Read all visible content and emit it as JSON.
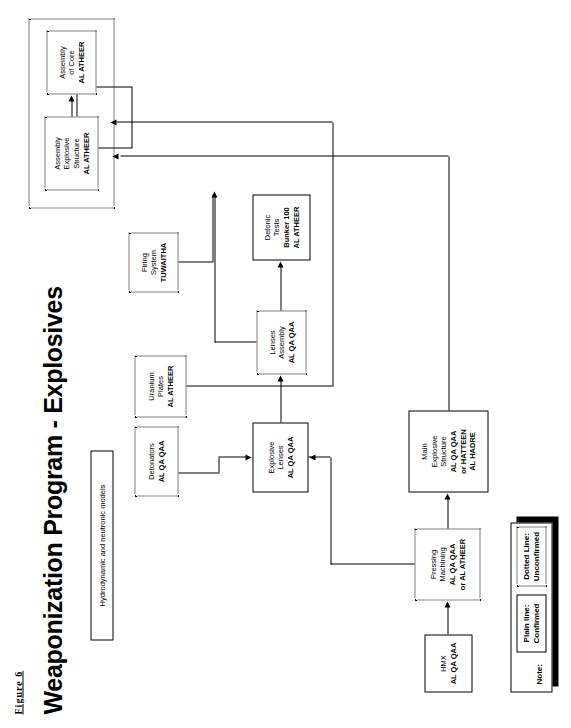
{
  "figure": {
    "label": "Figure 6"
  },
  "title": "Weaponization Program - Explosives",
  "nodes": {
    "models": {
      "lines": [
        "Hydrodynamic and neutronic models"
      ],
      "style": "solid"
    },
    "detonators": {
      "lines": [
        "Detonators",
        "AL QA QAA"
      ],
      "style": "dotted"
    },
    "uranium": {
      "lines": [
        "Uranium",
        "Plates",
        "AL ATHEER"
      ],
      "style": "dotted"
    },
    "hmx": {
      "lines": [
        "HMX",
        "AL QA QAA"
      ],
      "style": "solid"
    },
    "pressing": {
      "lines": [
        "Pressing",
        "Machining",
        "AL QA QAA",
        "or AL ATHEER"
      ],
      "style": "dotted"
    },
    "lenses": {
      "lines": [
        "Explosive",
        "Lenses",
        "AL QA QAA"
      ],
      "style": "solid"
    },
    "main_exp": {
      "lines": [
        "Main",
        "Explosive",
        "Structure",
        "AL QA QAA",
        "or HATTEEN",
        "AL HADRE"
      ],
      "style": "solid"
    },
    "lens_asm": {
      "lines": [
        "Lenses",
        "Assembly",
        "AL QA QAA"
      ],
      "style": "dotted"
    },
    "detonic": {
      "lines": [
        "Detonic",
        "Tests",
        "Bunker 100",
        "AL ATHEER"
      ],
      "style": "solid"
    },
    "firing": {
      "lines": [
        "Firing",
        "System",
        "TUWAITHA"
      ],
      "style": "dotted"
    },
    "asm_exp": {
      "lines": [
        "Assembly",
        "Explosive",
        "Structure",
        "AL ATHEER"
      ],
      "style": "dotted"
    },
    "asm_core": {
      "lines": [
        "Assembly",
        "of Core",
        "AL ATHEER"
      ],
      "style": "dotted"
    }
  },
  "bold_from": {
    "models": 9,
    "detonators": 1,
    "uranium": 2,
    "hmx": 1,
    "pressing": 2,
    "lenses": 2,
    "main_exp": 3,
    "lens_asm": 2,
    "detonic": 2,
    "firing": 2,
    "asm_exp": 3,
    "asm_core": 2
  },
  "note": {
    "title": "Note:",
    "items": [
      {
        "lines": [
          "Plain line:",
          "Confirmed"
        ],
        "style": "solid"
      },
      {
        "lines": [
          "Dotted Line:",
          "Unconfirmed"
        ],
        "style": "dotted"
      }
    ]
  },
  "colors": {
    "ink": "#000000",
    "paper": "#ffffff"
  }
}
